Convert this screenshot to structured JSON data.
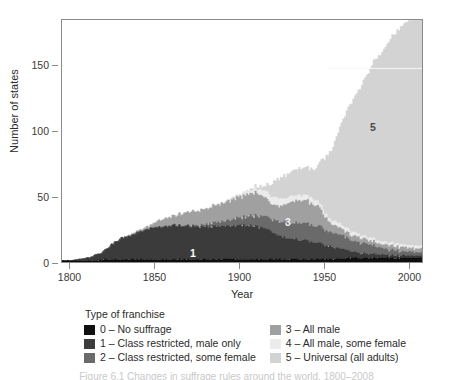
{
  "figure": {
    "background": "#ffffff",
    "frame_color": "#8a8a8a"
  },
  "axes": {
    "y_title": "Number of states",
    "x_title": "Year",
    "y_ticks": [
      "0",
      "50",
      "100",
      "150"
    ],
    "x_ticks": [
      "1800",
      "1850",
      "1900",
      "1950",
      "2000"
    ]
  },
  "legend": {
    "title": "Type of franchise",
    "left_items": [
      {
        "key": "0",
        "label": "0 – No suffrage",
        "color": "#100f0f"
      },
      {
        "key": "1",
        "label": "1 – Class restricted, male only",
        "color": "#3b3b3b"
      },
      {
        "key": "2",
        "label": "2 – Class restricted, some female",
        "color": "#6a6a6a"
      }
    ],
    "right_items": [
      {
        "key": "3",
        "label": "3 – All male",
        "color": "#a0a0a0"
      },
      {
        "key": "4",
        "label": "4 – All male, some female",
        "color": "#ebebeb"
      },
      {
        "key": "5",
        "label": "5 – Universal (all adults)",
        "color": "#d3d3d3"
      }
    ]
  },
  "annotations": [
    {
      "text": "1",
      "year": 1872,
      "value": 8,
      "color": "#ffffff"
    },
    {
      "text": "3",
      "year": 1928,
      "value": 32,
      "color": "#f2f2f2"
    },
    {
      "text": "5",
      "year": 1978,
      "value": 104,
      "color": "#4a4a4a"
    }
  ],
  "caption_partial": "Figure 6.1   Changes in suffrage rules around the world, 1800–2008",
  "chart_data": {
    "type": "area",
    "stacked": true,
    "title": "",
    "xlabel": "Year",
    "ylabel": "Number of states",
    "xlim": [
      1795,
      2008
    ],
    "ylim": [
      0,
      185
    ],
    "grid": false,
    "legend_position": "below-plot",
    "legend_title": "Type of franchise",
    "x": [
      1795,
      1800,
      1805,
      1810,
      1815,
      1820,
      1825,
      1830,
      1835,
      1840,
      1845,
      1850,
      1855,
      1860,
      1865,
      1870,
      1875,
      1880,
      1885,
      1890,
      1895,
      1900,
      1905,
      1910,
      1915,
      1920,
      1925,
      1930,
      1935,
      1940,
      1945,
      1950,
      1955,
      1960,
      1965,
      1970,
      1975,
      1980,
      1985,
      1990,
      1995,
      2000,
      2005,
      2008
    ],
    "series": [
      {
        "name": "0 – No suffrage",
        "key": "0",
        "color": "#100f0f",
        "values": [
          1,
          1,
          1,
          1,
          1,
          2,
          2,
          2,
          2,
          2,
          2,
          2,
          2,
          2,
          2,
          2,
          2,
          2,
          2,
          2,
          2,
          2,
          2,
          2,
          2,
          2,
          2,
          2,
          2,
          2,
          2,
          2,
          2,
          3,
          3,
          3,
          3,
          3,
          3,
          3,
          3,
          3,
          3,
          3
        ]
      },
      {
        "name": "1 – Class restricted, male only",
        "key": "1",
        "color": "#3b3b3b",
        "values": [
          0,
          0,
          1,
          2,
          4,
          7,
          12,
          16,
          18,
          21,
          23,
          25,
          25,
          26,
          26,
          25,
          25,
          25,
          25,
          25,
          25,
          26,
          26,
          25,
          24,
          20,
          17,
          16,
          15,
          14,
          13,
          11,
          9,
          7,
          5,
          4,
          3,
          3,
          2,
          2,
          2,
          2,
          2,
          2
        ]
      },
      {
        "name": "2 – Class restricted, some female",
        "key": "2",
        "color": "#6a6a6a",
        "values": [
          0,
          0,
          0,
          0,
          0,
          0,
          0,
          0,
          0,
          0,
          0,
          0,
          0,
          0,
          0,
          1,
          1,
          2,
          3,
          4,
          5,
          6,
          7,
          8,
          9,
          10,
          11,
          12,
          13,
          13,
          13,
          12,
          11,
          10,
          9,
          8,
          7,
          6,
          5,
          4,
          3,
          3,
          2,
          2
        ]
      },
      {
        "name": "3 – All male",
        "key": "3",
        "color": "#a0a0a0",
        "values": [
          0,
          0,
          0,
          0,
          0,
          0,
          0,
          0,
          1,
          1,
          2,
          4,
          6,
          7,
          9,
          10,
          11,
          12,
          13,
          14,
          15,
          16,
          17,
          17,
          14,
          11,
          13,
          16,
          17,
          17,
          16,
          10,
          6,
          5,
          4,
          4,
          3,
          3,
          3,
          3,
          3,
          3,
          3,
          3
        ]
      },
      {
        "name": "4 – All male, some female",
        "key": "4",
        "color": "#ebebeb",
        "values": [
          0,
          0,
          0,
          0,
          0,
          0,
          0,
          0,
          0,
          0,
          0,
          0,
          0,
          0,
          0,
          0,
          0,
          0,
          0,
          0,
          1,
          1,
          2,
          3,
          5,
          6,
          5,
          4,
          4,
          4,
          4,
          3,
          3,
          3,
          3,
          2,
          2,
          2,
          2,
          2,
          2,
          2,
          2,
          2
        ]
      },
      {
        "name": "5 – Universal (all adults)",
        "key": "5",
        "color": "#d3d3d3",
        "values": [
          0,
          0,
          0,
          0,
          0,
          0,
          0,
          0,
          0,
          0,
          0,
          0,
          0,
          0,
          0,
          0,
          0,
          0,
          0,
          0,
          0,
          0,
          1,
          2,
          4,
          12,
          17,
          19,
          21,
          22,
          24,
          42,
          57,
          78,
          96,
          110,
          124,
          138,
          147,
          158,
          166,
          172,
          176,
          176
        ]
      }
    ],
    "totals_note": "Stacked total rises from ~1 state in 1795 to ~180 states by 2008"
  }
}
